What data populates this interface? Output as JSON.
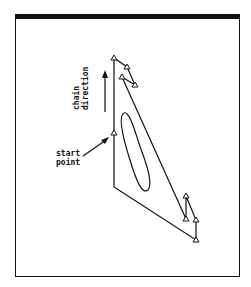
{
  "figure": {
    "labels": {
      "start_line1": "start",
      "start_line2": "point",
      "chain_line1": "chain",
      "chain_line2": "direction"
    },
    "colors": {
      "ink": "#111111",
      "background": "#ffffff"
    },
    "markers": [
      {
        "x": 114,
        "y": 58
      },
      {
        "x": 127,
        "y": 67
      },
      {
        "x": 122,
        "y": 77
      },
      {
        "x": 135,
        "y": 85
      },
      {
        "x": 114,
        "y": 133
      },
      {
        "x": 186,
        "y": 196
      },
      {
        "x": 186,
        "y": 219
      },
      {
        "x": 196,
        "y": 220
      },
      {
        "x": 196,
        "y": 240
      }
    ],
    "marker_shape": "triangle"
  }
}
